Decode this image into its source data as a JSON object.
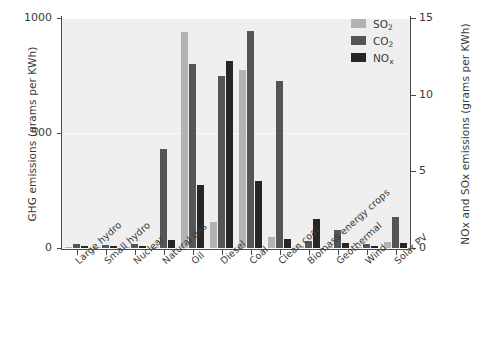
{
  "chart_data": {
    "type": "bar",
    "title": "",
    "subtitle": "",
    "categories": [
      "Large hydro",
      "Small hydro",
      "Nuclear",
      "Natural gas",
      "Oil",
      "Diesel",
      "Coal",
      "Clean coal",
      "Biomass energy crops",
      "Geothermal",
      "Wind",
      "Solar PV"
    ],
    "series": [
      {
        "name": "SO2",
        "label": "SO",
        "sub": "2",
        "axis": "right",
        "color": "#b3b3b3",
        "values": [
          0.05,
          0.08,
          0.05,
          0.05,
          14.1,
          1.7,
          11.6,
          0.75,
          0.1,
          0.05,
          0.05,
          0.4
        ]
      },
      {
        "name": "CO2",
        "label": "CO",
        "sub": "2",
        "axis": "left",
        "color": "#555555",
        "values": [
          16,
          12,
          17,
          430,
          800,
          750,
          945,
          725,
          32,
          80,
          16,
          135
        ]
      },
      {
        "name": "NOx",
        "label": "NO",
        "sub": "x",
        "axis": "right",
        "color": "#262626",
        "values": [
          0.1,
          0.1,
          0.1,
          0.55,
          4.1,
          12.2,
          4.35,
          0.6,
          1.9,
          0.35,
          0.1,
          0.3
        ]
      }
    ],
    "xlabel": "",
    "ylabel_left": "GHG emissions (grams per KWh)",
    "ylabel_right": "NOx and SOx emissions (grams per KWh)",
    "ylim_left": [
      0,
      1000
    ],
    "ylim_right": [
      0,
      15
    ],
    "yticks_left": [
      "0",
      "500",
      "1000"
    ],
    "ytick_values_left": [
      0,
      500,
      1000
    ],
    "yticks_right": [
      "0",
      "5",
      "10",
      "15"
    ],
    "ytick_values_right": [
      0,
      5,
      10,
      15
    ],
    "grid": true,
    "legend_position": "top-right",
    "plot_background": "#efefef",
    "axis_color": "#4a4a4a"
  }
}
